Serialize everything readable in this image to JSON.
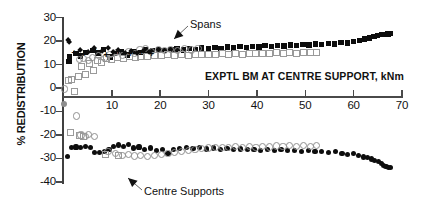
{
  "chart_data": {
    "type": "scatter",
    "title": "",
    "xlabel": "EXPTL BM AT CENTRE SUPPORT, kNm",
    "ylabel": "% REDISTRIBUTION",
    "xlim": [
      0,
      70
    ],
    "ylim": [
      -40,
      30
    ],
    "xticks": [
      0,
      10,
      20,
      30,
      40,
      50,
      60,
      70
    ],
    "yticks": [
      30,
      20,
      10,
      0,
      -10,
      -20,
      -30,
      -40
    ],
    "xtick_labels": [
      "",
      "10",
      "20",
      "30",
      "40",
      "50",
      "60",
      "70"
    ],
    "ytick_labels": [
      "30",
      "20",
      "10",
      "0",
      "-10",
      "-20",
      "-30",
      "-40"
    ],
    "grid": false,
    "legend": "none",
    "annotations": [
      {
        "text": "Spans",
        "x": 26.5,
        "y": 24.5,
        "points_to_x": 22.5,
        "points_to_y": 19.0
      },
      {
        "text": "Centre Supports",
        "x": 17.0,
        "y": -36.0,
        "points_to_x": 14.0,
        "points_to_y": -30.5
      }
    ],
    "series": [
      {
        "name": "Spans - filled squares",
        "marker": "filled-square",
        "points": [
          [
            1.1,
            11.2
          ],
          [
            1.3,
            13.4
          ],
          [
            2.6,
            14.8
          ],
          [
            3.5,
            13.6
          ],
          [
            4.6,
            15.2
          ],
          [
            6.1,
            16.1
          ],
          [
            7.1,
            15.0
          ],
          [
            8.3,
            16.4
          ],
          [
            9.6,
            13.2
          ],
          [
            10.6,
            14.6
          ],
          [
            11.9,
            15.3
          ],
          [
            13.2,
            14.1
          ],
          [
            14.6,
            15.6
          ],
          [
            15.9,
            15.1
          ],
          [
            17.0,
            16.2
          ],
          [
            18.4,
            15.9
          ],
          [
            19.6,
            16.5
          ],
          [
            20.8,
            16.0
          ],
          [
            22.2,
            16.3
          ],
          [
            23.5,
            16.6
          ],
          [
            24.8,
            16.2
          ],
          [
            26.1,
            16.8
          ],
          [
            27.3,
            16.4
          ],
          [
            28.6,
            17.0
          ],
          [
            30.0,
            16.7
          ],
          [
            31.3,
            17.2
          ],
          [
            32.6,
            16.9
          ],
          [
            33.9,
            17.4
          ],
          [
            35.2,
            17.1
          ],
          [
            36.5,
            17.6
          ],
          [
            37.8,
            17.3
          ],
          [
            39.1,
            17.8
          ],
          [
            40.4,
            17.5
          ],
          [
            41.7,
            18.0
          ],
          [
            43.0,
            17.7
          ],
          [
            44.3,
            18.2
          ],
          [
            45.6,
            17.9
          ],
          [
            46.9,
            18.4
          ],
          [
            48.2,
            18.1
          ],
          [
            49.5,
            18.6
          ],
          [
            50.8,
            18.3
          ],
          [
            52.1,
            18.8
          ],
          [
            53.4,
            18.5
          ],
          [
            54.8,
            19.0
          ],
          [
            56.1,
            18.8
          ],
          [
            57.4,
            19.3
          ],
          [
            58.7,
            19.2
          ],
          [
            60.0,
            19.8
          ],
          [
            61.2,
            20.3
          ],
          [
            62.3,
            20.9
          ],
          [
            63.3,
            21.4
          ],
          [
            64.2,
            21.9
          ],
          [
            65.0,
            22.3
          ],
          [
            65.8,
            22.7
          ],
          [
            66.5,
            22.9
          ],
          [
            67.1,
            23.1
          ],
          [
            67.6,
            23.2
          ]
        ]
      },
      {
        "name": "Spans - open squares",
        "marker": "open-square",
        "points": [
          [
            0.9,
            3.6
          ],
          [
            1.4,
            3.9
          ],
          [
            2.0,
            -1.0
          ],
          [
            2.8,
            5.4
          ],
          [
            3.6,
            9.8
          ],
          [
            4.3,
            6.2
          ],
          [
            5.2,
            11.0
          ],
          [
            6.0,
            8.1
          ],
          [
            6.8,
            12.0
          ],
          [
            7.6,
            11.4
          ],
          [
            8.6,
            13.0
          ],
          [
            9.8,
            12.4
          ],
          [
            11.0,
            13.5
          ],
          [
            12.2,
            13.0
          ],
          [
            13.4,
            13.8
          ],
          [
            14.6,
            13.4
          ],
          [
            15.8,
            14.0
          ],
          [
            17.2,
            13.9
          ],
          [
            18.6,
            14.3
          ],
          [
            20.0,
            14.1
          ],
          [
            21.4,
            14.5
          ],
          [
            22.8,
            14.2
          ],
          [
            24.2,
            14.6
          ],
          [
            25.6,
            14.4
          ],
          [
            27.0,
            14.8
          ],
          [
            28.4,
            14.5
          ],
          [
            29.8,
            14.9
          ],
          [
            31.2,
            14.7
          ],
          [
            32.6,
            15.0
          ],
          [
            34.0,
            14.8
          ],
          [
            35.4,
            15.1
          ],
          [
            36.8,
            14.9
          ],
          [
            38.2,
            15.2
          ],
          [
            39.6,
            15.0
          ],
          [
            41.0,
            15.3
          ],
          [
            42.4,
            15.1
          ],
          [
            43.8,
            15.4
          ],
          [
            45.2,
            15.2
          ],
          [
            46.6,
            15.5
          ],
          [
            48.0,
            15.3
          ],
          [
            49.4,
            15.6
          ],
          [
            50.8,
            15.4
          ],
          [
            52.2,
            15.7
          ]
        ]
      },
      {
        "name": "Spans - open circles",
        "marker": "open-circle",
        "points": [
          [
            0.0,
            0.0
          ],
          [
            3.1,
            12.6
          ],
          [
            4.0,
            13.1
          ],
          [
            4.9,
            12.2
          ],
          [
            5.8,
            13.6
          ],
          [
            7.0,
            14.2
          ],
          [
            8.2,
            13.1
          ],
          [
            9.4,
            14.7
          ],
          [
            10.8,
            15.4
          ],
          [
            12.0,
            14.3
          ],
          [
            13.3,
            16.0
          ],
          [
            14.4,
            15.3
          ],
          [
            15.6,
            16.6
          ],
          [
            16.8,
            17.2
          ],
          [
            18.0,
            16.1
          ],
          [
            19.4,
            16.9
          ],
          [
            20.6,
            16.3
          ],
          [
            22.0,
            17.0
          ],
          [
            23.4,
            16.5
          ],
          [
            24.8,
            17.1
          ],
          [
            26.2,
            16.6
          ],
          [
            27.6,
            17.2
          ]
        ]
      },
      {
        "name": "Spans - filled diamonds",
        "marker": "filled-diamond",
        "points": [
          [
            1.0,
            20.4
          ],
          [
            1.2,
            19.6
          ],
          [
            3.4,
            16.2
          ],
          [
            5.0,
            15.4
          ],
          [
            6.4,
            16.8
          ],
          [
            8.0,
            15.6
          ],
          [
            9.2,
            16.9
          ],
          [
            10.2,
            15.1
          ],
          [
            11.4,
            16.2
          ],
          [
            12.8,
            14.8
          ],
          [
            14.0,
            15.8
          ],
          [
            15.2,
            14.9
          ],
          [
            16.4,
            15.9
          ],
          [
            17.8,
            15.2
          ]
        ]
      },
      {
        "name": "Spans - plus markers",
        "marker": "plus",
        "points": [
          [
            2.2,
            15.1
          ],
          [
            4.2,
            14.4
          ],
          [
            6.6,
            15.9
          ],
          [
            8.8,
            14.2
          ],
          [
            11.2,
            15.5
          ],
          [
            13.8,
            14.3
          ],
          [
            16.0,
            15.0
          ],
          [
            18.2,
            14.6
          ]
        ]
      },
      {
        "name": "Centre Supports - filled circles",
        "marker": "filled-circle",
        "points": [
          [
            0.9,
            -29.1
          ],
          [
            1.6,
            -25.4
          ],
          [
            2.6,
            -25.2
          ],
          [
            3.6,
            -25.4
          ],
          [
            4.6,
            -25.0
          ],
          [
            5.6,
            -25.3
          ],
          [
            6.4,
            -27.4
          ],
          [
            7.4,
            -27.6
          ],
          [
            8.4,
            -27.2
          ],
          [
            9.4,
            -26.2
          ],
          [
            10.4,
            -24.8
          ],
          [
            11.4,
            -24.3
          ],
          [
            12.4,
            -25.0
          ],
          [
            13.4,
            -24.2
          ],
          [
            14.4,
            -25.6
          ],
          [
            15.6,
            -25.2
          ],
          [
            16.8,
            -26.3
          ],
          [
            18.0,
            -25.6
          ],
          [
            19.2,
            -26.8
          ],
          [
            20.4,
            -26.2
          ],
          [
            21.6,
            -28.0
          ],
          [
            22.8,
            -26.4
          ],
          [
            24.0,
            -25.8
          ],
          [
            25.4,
            -25.4
          ],
          [
            26.8,
            -25.9
          ],
          [
            28.2,
            -25.5
          ],
          [
            29.6,
            -26.0
          ],
          [
            31.0,
            -25.6
          ],
          [
            32.4,
            -26.1
          ],
          [
            33.8,
            -25.8
          ],
          [
            35.2,
            -26.3
          ],
          [
            36.6,
            -26.0
          ],
          [
            38.0,
            -26.4
          ],
          [
            39.4,
            -26.1
          ],
          [
            40.8,
            -26.5
          ],
          [
            42.2,
            -26.2
          ],
          [
            43.6,
            -26.7
          ],
          [
            45.0,
            -26.4
          ],
          [
            46.4,
            -26.8
          ],
          [
            47.8,
            -26.6
          ],
          [
            49.2,
            -27.0
          ],
          [
            50.6,
            -26.8
          ],
          [
            52.0,
            -27.2
          ],
          [
            53.4,
            -27.0
          ],
          [
            54.8,
            -27.4
          ],
          [
            56.2,
            -27.2
          ],
          [
            57.6,
            -27.8
          ],
          [
            58.8,
            -28.2
          ],
          [
            60.0,
            -28.0
          ],
          [
            61.0,
            -28.8
          ],
          [
            62.0,
            -29.4
          ],
          [
            62.9,
            -29.8
          ],
          [
            63.7,
            -30.3
          ],
          [
            64.4,
            -30.9
          ],
          [
            65.1,
            -31.5
          ],
          [
            65.7,
            -32.3
          ],
          [
            66.2,
            -33.0
          ],
          [
            66.7,
            -33.5
          ],
          [
            67.2,
            -33.8
          ],
          [
            67.6,
            -33.9
          ]
        ]
      },
      {
        "name": "Centre Supports - open circles",
        "marker": "open-circle",
        "points": [
          [
            2.4,
            -11.5
          ],
          [
            3.4,
            -19.6
          ],
          [
            4.4,
            -20.4
          ],
          [
            5.0,
            -19.3
          ],
          [
            6.2,
            -20.2
          ],
          [
            9.0,
            -26.6
          ],
          [
            10.6,
            -27.6
          ],
          [
            12.0,
            -28.2
          ],
          [
            13.2,
            -28.0
          ],
          [
            14.4,
            -28.6
          ],
          [
            15.8,
            -28.3
          ],
          [
            17.2,
            -28.8
          ],
          [
            18.6,
            -28.4
          ],
          [
            20.0,
            -28.0
          ],
          [
            21.4,
            -27.6
          ],
          [
            22.8,
            -27.0
          ],
          [
            24.2,
            -26.6
          ],
          [
            25.6,
            -26.2
          ],
          [
            27.0,
            -25.8
          ],
          [
            28.4,
            -25.4
          ],
          [
            29.8,
            -25.2
          ],
          [
            31.2,
            -25.0
          ],
          [
            32.6,
            -24.8
          ],
          [
            34.0,
            -25.0
          ],
          [
            35.4,
            -24.6
          ],
          [
            36.8,
            -24.9
          ],
          [
            38.2,
            -24.5
          ],
          [
            39.6,
            -24.8
          ],
          [
            41.0,
            -24.4
          ],
          [
            42.4,
            -24.7
          ],
          [
            43.8,
            -24.3
          ],
          [
            45.2,
            -24.6
          ],
          [
            46.6,
            -24.2
          ],
          [
            48.0,
            -24.5
          ],
          [
            49.4,
            -24.1
          ],
          [
            50.8,
            -24.4
          ],
          [
            52.2,
            -24.0
          ]
        ]
      },
      {
        "name": "Centre Supports - open squares",
        "marker": "open-square",
        "points": [
          [
            1.2,
            -18.6
          ],
          [
            3.0,
            -20.0
          ],
          [
            4.0,
            -20.2
          ],
          [
            8.5,
            -27.8
          ],
          [
            11.2,
            -28.4
          ]
        ]
      },
      {
        "name": "Centre Supports - grey circle at origin",
        "marker": "grey-circle",
        "points": [
          [
            0.0,
            -7.0
          ]
        ]
      }
    ]
  }
}
